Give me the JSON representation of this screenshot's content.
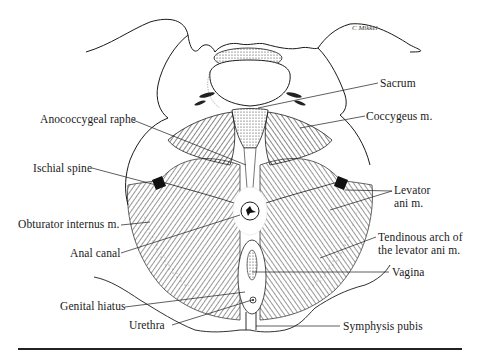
{
  "figure": {
    "signature": "C Mikkel",
    "labels": {
      "sacrum": "Sacrum",
      "coccygeus": "Coccygeus m.",
      "anococcygeal_raphe": "Anococcygeal raphe",
      "ischial_spine": "Ischial spine",
      "levator_ani_line1": "Levator",
      "levator_ani_line2": "ani m.",
      "obturator_internus": "Obturator internus m.",
      "anal_canal": "Anal canal",
      "tendinous_arch_line1": "Tendinous arch of",
      "tendinous_arch_line2": "the levator ani m.",
      "vagina": "Vagina",
      "genital_hiatus": "Genital hiatus",
      "urethra": "Urethra",
      "symphysis_pubis": "Symphysis pubis"
    }
  },
  "colors": {
    "ink": "#1a1a1a",
    "background": "#ffffff"
  }
}
